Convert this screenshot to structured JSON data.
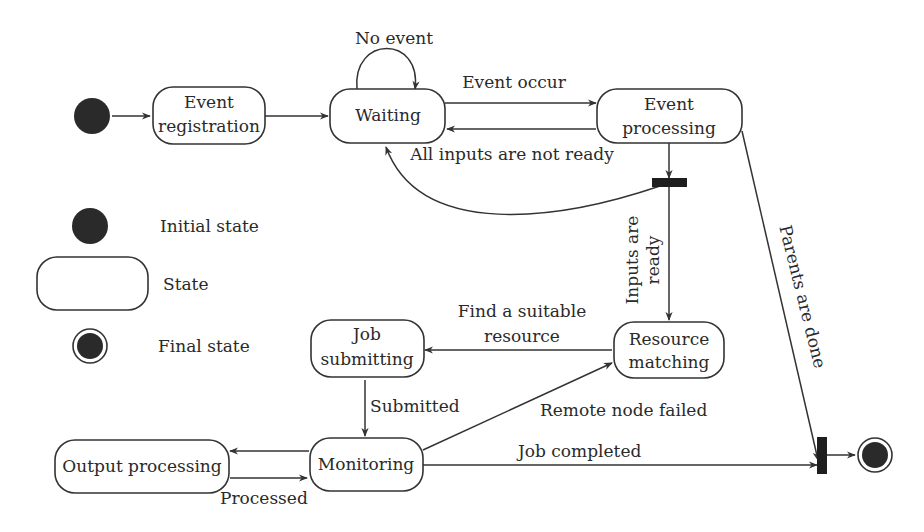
{
  "diagram": {
    "type": "UML state diagram",
    "states": {
      "event_registration": [
        "Event",
        "registration"
      ],
      "waiting": "Waiting",
      "event_processing": [
        "Event",
        "processing"
      ],
      "resource_matching": [
        "Resource",
        "matching"
      ],
      "job_submitting": [
        "Job",
        "submitting"
      ],
      "monitoring": "Monitoring",
      "output_processing": "Output processing"
    },
    "transitions": {
      "no_event": "No event",
      "event_occur": "Event occur",
      "inputs_not_ready": "All inputs are not ready",
      "inputs_ready": [
        "Inputs are",
        "ready"
      ],
      "parents_done": "Parents are done",
      "find_resource": [
        "Find a suitable",
        "resource"
      ],
      "submitted": "Submitted",
      "remote_failed": "Remote node failed",
      "job_completed": "Job completed",
      "processed": "Processed"
    },
    "legend": {
      "initial": "Initial state",
      "state": "State",
      "final": "Final state"
    }
  }
}
